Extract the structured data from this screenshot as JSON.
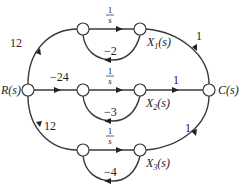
{
  "diagram": {
    "type": "signal-flow-graph",
    "nodes": {
      "input": {
        "label": "R(s)"
      },
      "output": {
        "label": "C(s)"
      },
      "x1": {
        "label": "X",
        "sub": "1",
        "arg": "(s)"
      },
      "x2": {
        "label": "X",
        "sub": "2",
        "arg": "(s)"
      },
      "x3": {
        "label": "X",
        "sub": "3",
        "arg": "(s)"
      }
    },
    "branches": {
      "top": {
        "input_gain": "12",
        "forward_num": "1",
        "forward_den": "s",
        "feedback_gain": "−2",
        "output_gain": "1"
      },
      "middle": {
        "input_gain": "−24",
        "forward_num": "1",
        "forward_den": "s",
        "feedback_gain": "−3",
        "output_gain": "1"
      },
      "bottom": {
        "input_gain": "12",
        "forward_num": "1",
        "forward_den": "s",
        "feedback_gain": "−4",
        "output_gain": "1"
      }
    }
  }
}
